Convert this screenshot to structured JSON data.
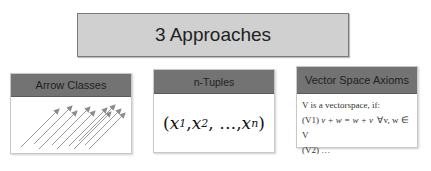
{
  "title": "3 Approaches",
  "colors": {
    "title_bg": "#d0d0d0",
    "header_bg": "#737373",
    "arrow": "#8c8c8c"
  },
  "cards": [
    {
      "header": "Arrow Classes",
      "arrow_count": 10
    },
    {
      "header": "n-Tuples",
      "tuple": {
        "open": "(",
        "x1": "x",
        "s1": "1",
        "sep1": ", ",
        "x2": "x",
        "s2": "2",
        "sep2": ", …, ",
        "xn": "x",
        "sn": "n",
        "close": ")"
      }
    },
    {
      "header": "Vector Space Axioms",
      "lines": [
        "V is a vectorspace, if:",
        "(V1) ",
        "(V2) …"
      ],
      "v1_math": "v + w = w + v",
      "v1_quant": "∀v, w ∈ V"
    }
  ]
}
